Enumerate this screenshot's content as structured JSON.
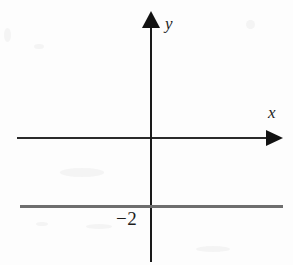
{
  "figure": {
    "background_color": "#fdfdfd",
    "axis_color": "#2a2a2a",
    "plot_line_color": "#6e6e6e",
    "text_color": "#1d1d1d"
  },
  "axes": {
    "x_label": "x",
    "y_label": "y"
  },
  "ticks": {
    "y_negative_two": "−2"
  },
  "chart_data": {
    "type": "line",
    "title": "",
    "subtitle": "",
    "xlabel": "x",
    "ylabel": "y",
    "grid": false,
    "legend": null,
    "axis_style": "arrows-both-ends",
    "xlim": [
      -5.2,
      5.2
    ],
    "ylim": [
      -5.2,
      5.2
    ],
    "xticks": [],
    "yticks": [
      -2
    ],
    "ytick_labels": [
      "−2"
    ],
    "series": [
      {
        "name": "y = -2",
        "equation": "y = -2",
        "kind": "horizontal-line",
        "color": "#6e6e6e",
        "x": [
          -5.2,
          5.2
        ],
        "values": [
          -2,
          -2
        ]
      }
    ],
    "annotations": [
      {
        "text": "y",
        "role": "y-axis-name",
        "x": 0.3,
        "y": 5.0
      },
      {
        "text": "x",
        "role": "x-axis-name",
        "x": 4.9,
        "y": 0.7
      },
      {
        "text": "−2",
        "role": "y-intercept-label",
        "x": -0.7,
        "y": -2.5
      }
    ]
  }
}
